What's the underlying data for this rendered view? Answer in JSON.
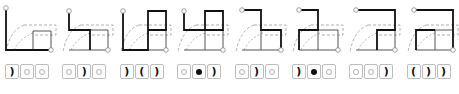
{
  "figure": {
    "panel_count": 8,
    "colors": {
      "path": "#111111",
      "grid": "#555555",
      "dashed": "#9a9a9a",
      "tile_border": "#bdbdbd",
      "endpoint": "#888888"
    }
  },
  "panels": [
    {
      "id": 1,
      "tiles": [
        "paren-right",
        "ring",
        "ring"
      ],
      "path": "M6 8 L6 50 L51 50",
      "box": "M33 31 L51 31 L51 50 M33 31 L33 50"
    },
    {
      "id": 2,
      "tiles": [
        "ring",
        "paren-right",
        "ring"
      ],
      "path": "M12 11 L12 30 L33 30 L33 50",
      "box": "M33 30 L51 30 L51 50 M12 50 L51 50"
    },
    {
      "id": 3,
      "tiles": [
        "paren-right",
        "paren-left",
        "paren-right"
      ],
      "path": "M8 11 L8 50 L33 50 L33 11 L51 11 L51 30 L33 30",
      "box": "M33 50 L51 50 L51 30"
    },
    {
      "id": 4,
      "tiles": [
        "ring",
        "dot",
        "paren-right"
      ],
      "path": "M12 11 L12 30 L33 30 L33 11 L51 11 L51 30 L33 30",
      "box": "M33 30 L33 50 M12 50 L51 50 L51 30"
    },
    {
      "id": 5,
      "tiles": [
        "ring",
        "paren-right",
        "ring"
      ],
      "path": "M12 10 L31 10 L31 30 L51 30 L51 50",
      "box": "M31 30 L31 50 M12 50 L51 50"
    },
    {
      "id": 6,
      "tiles": [
        "paren-right",
        "dot",
        "ring"
      ],
      "path": "M12 10 L31 10 L31 30 L12 30 L12 50",
      "box": "M31 30 L51 30 L51 50 L12 50 M31 30 L31 50"
    },
    {
      "id": 7,
      "tiles": [
        "ring",
        "ring",
        "paren-right"
      ],
      "path": "M12 10 L51 10 L51 30 L33 30 L33 50",
      "box": "M12 50 L51 50 M51 30 L51 50"
    },
    {
      "id": 8,
      "tiles": [
        "paren-left",
        "paren-right",
        "paren-right"
      ],
      "path": "M12 10 L51 10 L51 50 M33 30 L14 30 L14 50",
      "box": "M14 30 L33 30 L33 50 M14 50 L51 50 M33 30 L51 30"
    }
  ],
  "symbols": {
    "paren-right": ")",
    "paren-left": "(",
    "ring": "",
    "dot": ""
  },
  "caption": ""
}
